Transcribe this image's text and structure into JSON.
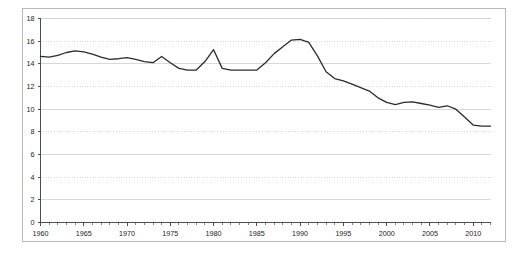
{
  "chart_data": {
    "type": "line",
    "title": "",
    "subtitle": "",
    "xlabel": "",
    "ylabel": "",
    "xlim": [
      1960,
      2012
    ],
    "ylim": [
      0,
      18
    ],
    "grid": true,
    "legend": "none",
    "y_ticks": [
      0,
      2,
      4,
      6,
      8,
      10,
      12,
      14,
      16,
      18
    ],
    "y_tick_labels": [
      "0",
      "2",
      "4",
      "6",
      "8",
      "10",
      "12",
      "14",
      "16",
      "18"
    ],
    "x_ticks": [
      1960,
      1965,
      1970,
      1975,
      1980,
      1985,
      1990,
      1995,
      2000,
      2005,
      2010
    ],
    "x_tick_labels": [
      "1960",
      "1965",
      "1970",
      "1975",
      "1980",
      "1985",
      "1990",
      "1995",
      "2000",
      "2005",
      "2010"
    ],
    "x_minor_tick_interval": 1,
    "line_color": "#2b2b2b",
    "grid_color": "#c8c8c8",
    "axis_color": "#4d4d4d",
    "frame_color": "#b9b9b9",
    "background_color": "#ffffff",
    "series": [
      {
        "name": "series-1",
        "x": [
          1960,
          1961,
          1962,
          1963,
          1964,
          1965,
          1966,
          1967,
          1968,
          1969,
          1970,
          1971,
          1972,
          1973,
          1974,
          1975,
          1976,
          1977,
          1978,
          1979,
          1980,
          1981,
          1982,
          1983,
          1984,
          1985,
          1986,
          1987,
          1988,
          1989,
          1990,
          1991,
          1992,
          1993,
          1994,
          1995,
          1996,
          1997,
          1998,
          1999,
          2000,
          2001,
          2002,
          2003,
          2004,
          2005,
          2006,
          2007,
          2008,
          2009,
          2010,
          2011,
          2012
        ],
        "values": [
          14.7,
          14.6,
          14.7,
          14.9,
          15.1,
          15.2,
          15.0,
          14.7,
          14.4,
          14.3,
          14.5,
          14.4,
          14.2,
          14.1,
          14.6,
          14.2,
          13.8,
          13.5,
          14.1,
          14.8,
          15.3,
          13.5,
          13.4,
          13.4,
          13.4,
          13.4,
          14.0,
          14.7,
          15.5,
          16.1,
          16.2,
          16.1,
          15.2,
          14.2,
          13.3,
          13.5,
          12.9,
          12.2,
          11.8,
          11.3,
          11.0,
          10.7,
          10.7,
          10.9,
          10.7,
          10.5,
          10.2,
          10.1,
          10.1,
          10.1,
          9.9,
          10.1,
          10.0
        ]
      }
    ],
    "note": "Single dark line trending downward from about 14.7 in 1960 to about 8.4 in 2012, with a peak near 16.2 around 1980 and a low near 7.8 around 2009"
  },
  "series_points": {
    "x": [
      1960,
      1961,
      1962,
      1963,
      1964,
      1965,
      1966,
      1967,
      1968,
      1969,
      1970,
      1971,
      1972,
      1973,
      1974,
      1975,
      1976,
      1977,
      1978,
      1979,
      1980,
      1981,
      1982,
      1983,
      1984,
      1985,
      1986,
      1987,
      1988,
      1989,
      1990,
      1991,
      1992,
      1993,
      1994,
      1995,
      1996,
      1997,
      1998,
      1999,
      2000,
      2001,
      2002,
      2003,
      2004,
      2005,
      2006,
      2007,
      2008,
      2009,
      2010,
      2011,
      2012
    ],
    "y": [
      14.65,
      14.6,
      14.75,
      15.0,
      15.15,
      15.05,
      14.85,
      14.6,
      14.4,
      14.45,
      14.55,
      14.4,
      14.2,
      14.1,
      14.65,
      14.1,
      13.6,
      13.45,
      13.45,
      14.2,
      15.25,
      13.6,
      13.45,
      13.45,
      13.45,
      13.45,
      14.1,
      14.9,
      15.5,
      16.1,
      16.15,
      15.9,
      14.7,
      13.3,
      12.7,
      12.5,
      12.2,
      11.9,
      11.6,
      11.0,
      10.6,
      10.4,
      10.6,
      10.65,
      10.5,
      10.35,
      10.15,
      10.3,
      10.0,
      9.3,
      8.6,
      8.5,
      8.5
    ]
  }
}
